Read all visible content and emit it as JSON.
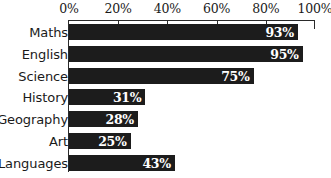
{
  "chart_data": {
    "type": "bar",
    "orientation": "horizontal",
    "title": "",
    "xlabel": "",
    "ylabel": "",
    "xlim": [
      0,
      100
    ],
    "grid": false,
    "legend": false,
    "value_suffix": "%",
    "categories": [
      "Maths",
      "English",
      "Science",
      "History",
      "Geography",
      "Art",
      "Languages"
    ],
    "values": [
      93,
      95,
      75,
      31,
      28,
      25,
      43
    ],
    "value_labels": [
      "93%",
      "95%",
      "75%",
      "31%",
      "28%",
      "25%",
      "43%"
    ],
    "x_ticks": [
      0,
      20,
      40,
      60,
      80,
      100
    ],
    "x_tick_labels": [
      "0%",
      "20%",
      "40%",
      "60%",
      "80%",
      "100%"
    ],
    "bar_color": "#1c1c1c",
    "value_label_color": "#ffffff",
    "axis_color": "#2a2a2a",
    "background_color": "#ffffff",
    "text_color": "#1a1a1a"
  }
}
